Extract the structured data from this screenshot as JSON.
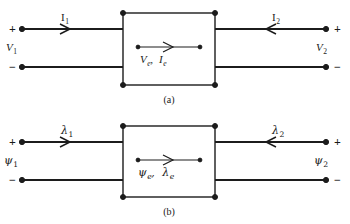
{
  "figure": {
    "background_color": "#ffffff",
    "line_color": "#1c1c1c",
    "diagrams": [
      {
        "id": "diagram-a",
        "caption": "(a)",
        "left_port": {
          "plus_sign": "+",
          "minus_sign": "−",
          "voltage_label": "V",
          "voltage_sub": "1",
          "current_label": "I",
          "current_sub": "1",
          "current_direction": "right"
        },
        "right_port": {
          "plus_sign": "+",
          "minus_sign": "−",
          "voltage_label": "V",
          "voltage_sub": "2",
          "current_label": "I",
          "current_sub": "2",
          "current_direction": "left"
        },
        "box_center": {
          "first_label": "V",
          "first_sub": "e",
          "separator": ",",
          "second_label": "I",
          "second_sub": "e",
          "arrow_direction": "right"
        }
      },
      {
        "id": "diagram-b",
        "caption": "(b)",
        "left_port": {
          "plus_sign": "+",
          "minus_sign": "−",
          "voltage_label": "ψ",
          "voltage_sub": "1",
          "current_label": "λ",
          "current_sub": "1",
          "current_direction": "right"
        },
        "right_port": {
          "plus_sign": "+",
          "minus_sign": "−",
          "voltage_label": "ψ",
          "voltage_sub": "2",
          "current_label": "λ",
          "current_sub": "2",
          "current_direction": "left"
        },
        "box_center": {
          "first_label": "ψ",
          "first_sub": "e",
          "separator": ",",
          "second_label": "λ",
          "second_sub": "e",
          "arrow_direction": "right"
        }
      }
    ]
  }
}
